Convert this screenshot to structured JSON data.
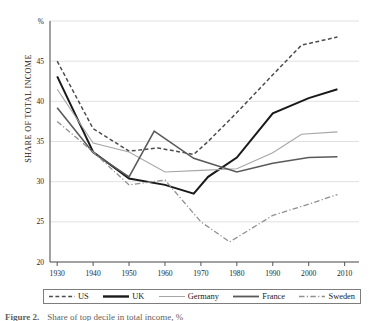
{
  "chart_data": {
    "type": "line",
    "title": "",
    "xlabel": "",
    "ylabel": "SHARE OF TOTAL INCOME",
    "yunit": "%",
    "x": [
      1930,
      1940,
      1950,
      1960,
      1970,
      1980,
      1990,
      2000,
      2010
    ],
    "xticklabels": [
      "1930",
      "1940",
      "1950",
      "1960",
      "1970",
      "1980",
      "1990",
      "2000",
      "2010"
    ],
    "yticks": [
      20,
      25,
      30,
      35,
      40,
      45
    ],
    "yticklabels": [
      "20",
      "25",
      "30",
      "35",
      "40",
      "45"
    ],
    "xlim": [
      1928,
      2014
    ],
    "ylim": [
      20,
      50
    ],
    "grid": "horizontal",
    "legend_position": "bottom",
    "series": [
      {
        "name": "US",
        "style": "dashed",
        "color": "#4d4d4d",
        "width": 1.5,
        "points": [
          [
            1930,
            45.0
          ],
          [
            1940,
            36.6
          ],
          [
            1950,
            33.8
          ],
          [
            1958,
            34.2
          ],
          [
            1968,
            33.4
          ],
          [
            1972,
            35.0
          ],
          [
            1980,
            38.6
          ],
          [
            1990,
            43.3
          ],
          [
            1998,
            47.0
          ],
          [
            2008,
            48.0
          ]
        ]
      },
      {
        "name": "UK",
        "style": "solid",
        "color": "#1a1a1a",
        "width": 2.0,
        "points": [
          [
            1930,
            43.1
          ],
          [
            1940,
            33.7
          ],
          [
            1950,
            30.4
          ],
          [
            1960,
            29.6
          ],
          [
            1968,
            28.5
          ],
          [
            1972,
            30.6
          ],
          [
            1980,
            33.0
          ],
          [
            1990,
            38.5
          ],
          [
            2000,
            40.4
          ],
          [
            2008,
            41.5
          ]
        ]
      },
      {
        "name": "Germany",
        "style": "solid",
        "color": "#a6a6a6",
        "width": 1.1,
        "points": [
          [
            1930,
            41.5
          ],
          [
            1940,
            34.8
          ],
          [
            1950,
            33.7
          ],
          [
            1960,
            31.2
          ],
          [
            1970,
            31.4
          ],
          [
            1980,
            31.6
          ],
          [
            1990,
            33.6
          ],
          [
            1998,
            35.9
          ],
          [
            2008,
            36.2
          ]
        ]
      },
      {
        "name": "France",
        "style": "solid",
        "color": "#5a5a5a",
        "width": 1.6,
        "points": [
          [
            1930,
            39.2
          ],
          [
            1940,
            33.6
          ],
          [
            1950,
            30.6
          ],
          [
            1957,
            36.3
          ],
          [
            1968,
            32.9
          ],
          [
            1980,
            31.2
          ],
          [
            1990,
            32.3
          ],
          [
            2000,
            33.0
          ],
          [
            2008,
            33.1
          ]
        ]
      },
      {
        "name": "Sweden",
        "style": "dashdot",
        "color": "#909090",
        "width": 1.3,
        "points": [
          [
            1930,
            37.5
          ],
          [
            1940,
            33.7
          ],
          [
            1950,
            29.6
          ],
          [
            1960,
            30.2
          ],
          [
            1970,
            25.0
          ],
          [
            1978,
            22.5
          ],
          [
            1990,
            25.8
          ],
          [
            2000,
            27.2
          ],
          [
            2008,
            28.4
          ]
        ]
      }
    ]
  },
  "legend": {
    "items": [
      {
        "label": "US",
        "style": "dashed",
        "color": "#4d4d4d",
        "width": 1.5
      },
      {
        "label": "UK",
        "style": "solid",
        "color": "#1a1a1a",
        "width": 2.4
      },
      {
        "label": "Germany",
        "style": "solid",
        "color": "#a6a6a6",
        "width": 1.0
      },
      {
        "label": "France",
        "style": "solid",
        "color": "#5a5a5a",
        "width": 1.8
      },
      {
        "label": "Sweden",
        "style": "dashdot",
        "color": "#909090",
        "width": 1.3
      }
    ]
  },
  "caption": {
    "label": "Figure 2.",
    "text": "Share of top decile in total income, %"
  }
}
